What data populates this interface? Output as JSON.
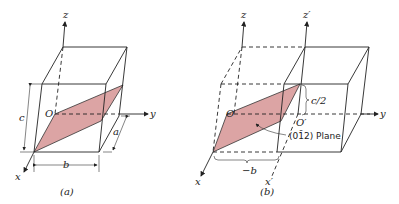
{
  "figure_a": {
    "caption": "(a)",
    "axes": {
      "x": "x",
      "y": "y",
      "z": "z"
    },
    "origin": "O",
    "dimensions": {
      "a": "a",
      "b": "b",
      "c": "c"
    },
    "plane_color": "#dca4a4"
  },
  "figure_b": {
    "caption": "(b)",
    "axes": {
      "x": "x",
      "y": "y",
      "z": "z",
      "x_prime": "x′",
      "z_prime": "z′"
    },
    "origin": "O",
    "origin_prime": "O′",
    "dimensions": {
      "c_half": "c/2",
      "neg_b": "−b"
    },
    "plane_label": "(01̄2) Plane",
    "plane_color": "#dca4a4"
  }
}
